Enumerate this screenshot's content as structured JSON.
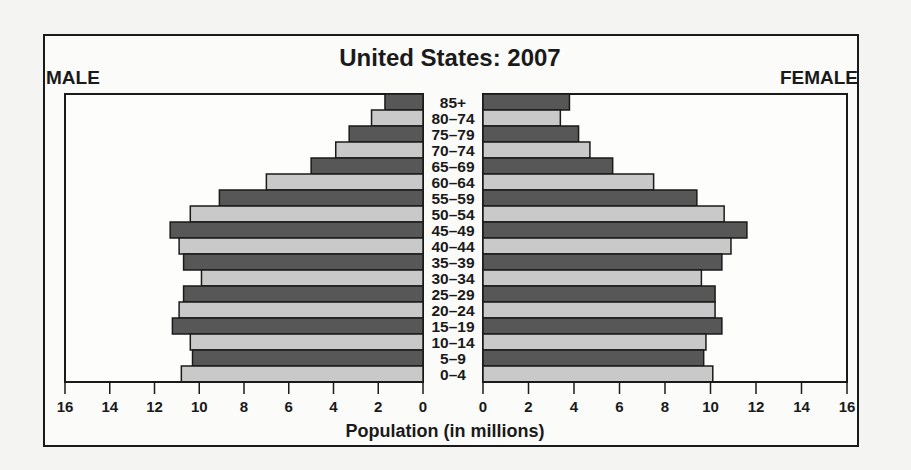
{
  "chart_data": {
    "type": "bar",
    "subtype": "population-pyramid",
    "title": "United States: 2007",
    "left_label": "MALE",
    "right_label": "FEMALE",
    "xlabel": "Population (in millions)",
    "xlim": [
      0,
      16
    ],
    "x_ticks": [
      0,
      2,
      4,
      6,
      8,
      10,
      12,
      14,
      16
    ],
    "x_tick_labels": [
      "0",
      "2",
      "4",
      "6",
      "8",
      "10",
      "12",
      "14",
      "16"
    ],
    "categories": [
      "85+",
      "80–74",
      "75–79",
      "70–74",
      "65–69",
      "60–64",
      "55–59",
      "50–54",
      "45–49",
      "40–44",
      "35–39",
      "30–34",
      "25–29",
      "20–24",
      "15–19",
      "10–14",
      "5–9",
      "0–4"
    ],
    "series": [
      {
        "name": "MALE",
        "values": [
          1.7,
          2.3,
          3.3,
          3.9,
          5.0,
          7.0,
          9.1,
          10.4,
          11.3,
          10.9,
          10.7,
          9.9,
          10.7,
          10.9,
          11.2,
          10.4,
          10.3,
          10.8
        ]
      },
      {
        "name": "FEMALE",
        "values": [
          3.8,
          3.4,
          4.2,
          4.7,
          5.7,
          7.5,
          9.4,
          10.6,
          11.6,
          10.9,
          10.5,
          9.6,
          10.2,
          10.2,
          10.5,
          9.8,
          9.7,
          10.1
        ]
      }
    ],
    "bar_colors": [
      "#575757",
      "#c9c9c9"
    ],
    "grid": false,
    "legend": "none"
  }
}
